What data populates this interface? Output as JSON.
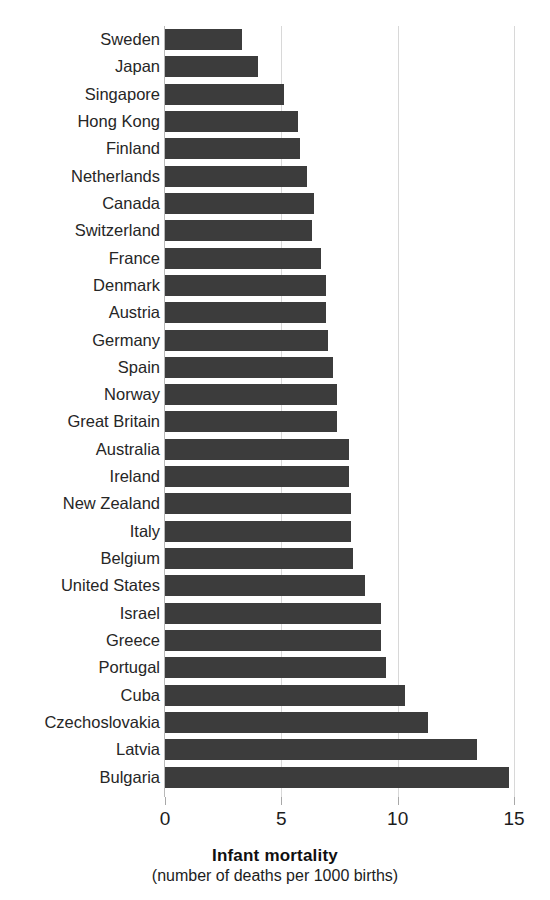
{
  "chart_data": {
    "type": "bar",
    "orientation": "horizontal",
    "title": "Infant mortality",
    "subtitle": "(number of deaths per 1000 births)",
    "xlabel": "Infant mortality",
    "ylabel": "",
    "xlim": [
      0,
      15
    ],
    "xticks": [
      0,
      5,
      10,
      15
    ],
    "xtick_labels": [
      "0",
      "5",
      "10",
      "15"
    ],
    "grid": true,
    "grid_axis": "x",
    "legend": false,
    "bar_color": "#3c3c3c",
    "background_color": "#ffffff",
    "categories": [
      "Sweden",
      "Japan",
      "Singapore",
      "Hong Kong",
      "Finland",
      "Netherlands",
      "Canada",
      "Switzerland",
      "France",
      "Denmark",
      "Austria",
      "Germany",
      "Spain",
      "Norway",
      "Great Britain",
      "Australia",
      "Ireland",
      "New Zealand",
      "Italy",
      "Belgium",
      "United States",
      "Israel",
      "Greece",
      "Portugal",
      "Cuba",
      "Czechoslovakia",
      "Latvia",
      "Bulgaria"
    ],
    "values": [
      3.3,
      4.0,
      5.1,
      5.7,
      5.8,
      6.1,
      6.4,
      6.3,
      6.7,
      6.9,
      6.9,
      7.0,
      7.2,
      7.4,
      7.4,
      7.9,
      7.9,
      8.0,
      8.0,
      8.1,
      8.6,
      9.3,
      9.3,
      9.5,
      10.3,
      11.3,
      13.4,
      14.8
    ]
  },
  "axis": {
    "title": "Infant mortality",
    "subtitle": "(number of deaths per 1000 births)"
  }
}
